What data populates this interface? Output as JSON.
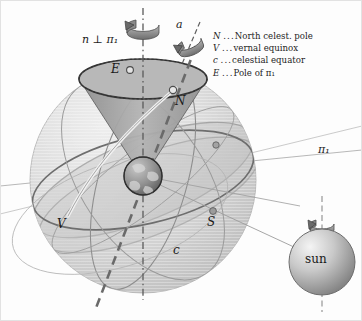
{
  "figure": {
    "width": 362,
    "height": 321
  },
  "legend": {
    "entries": [
      {
        "symbol": "N",
        "dots": "...",
        "text": "North celest. pole"
      },
      {
        "symbol": "V",
        "dots": "...",
        "text": "vernal equinox"
      },
      {
        "symbol": "c",
        "dots": "...",
        "text": "celestial equator"
      },
      {
        "symbol": "E",
        "dots": "...",
        "text": "Pole of π₁"
      }
    ]
  },
  "labels": {
    "normal_axis": "n ⊥ π₁",
    "spin_axis": "a",
    "pole_of_plane": "E",
    "north_pole": "N",
    "south_pole": "S",
    "vernal_equinox": "V",
    "celestial_equator": "c",
    "plane": "π₁",
    "sun": "sun"
  },
  "colors": {
    "sphere_fill": "#dcdcdc",
    "cone_fill": "#a9a9a9",
    "ecliptic_band": "#c8c8c8",
    "sun_light": "#f2f2f2",
    "sun_dark": "#8e8e8e",
    "earth_dark": "#6f6f6f",
    "line_dark": "#4a4a4a",
    "line_mid": "#8a8a8a",
    "text": "#1a1a1a",
    "background": "#fdfdfd"
  }
}
